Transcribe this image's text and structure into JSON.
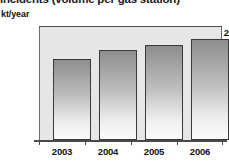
{
  "chart_data": {
    "type": "bar",
    "title": "Incidents (volume per gas station)",
    "subtitle": "",
    "xlabel": "",
    "ylabel": "kt/year",
    "categories": [
      "2003",
      "2004",
      "2005",
      "2006"
    ],
    "values": [
      1.53,
      1.7,
      1.79,
      1.91
    ],
    "series": [
      {
        "name": "kt/year",
        "values": [
          1.53,
          1.7,
          1.79,
          1.91
        ]
      }
    ],
    "ylim": [
      0,
      2.13
    ],
    "y_ticks": [
      "1",
      "2"
    ],
    "y_tick_values": [
      1,
      2
    ],
    "grid": false,
    "legend": false,
    "legend_position": "none",
    "bar_fill": "#9a9a9a",
    "bar_border": "#3a3a3a",
    "plot_background": "#e6e6e6",
    "axis_color": "#4a4a4a",
    "text_color": "#111111"
  }
}
